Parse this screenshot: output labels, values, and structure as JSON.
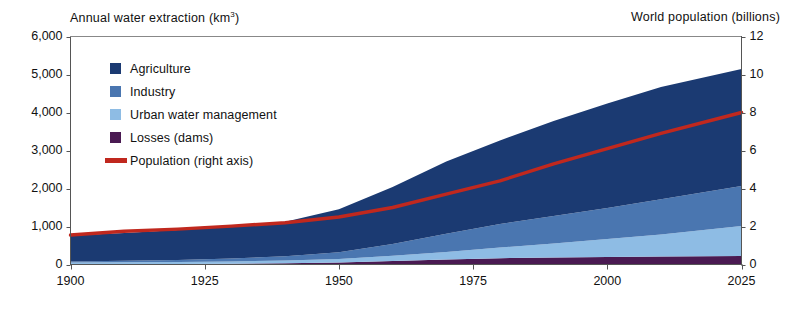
{
  "chart_data": {
    "type": "area",
    "title": "",
    "subtitle": "",
    "left_axis_title": "Annual water extraction (km",
    "left_axis_title_sup": "3",
    "left_axis_title_tail": ")",
    "right_axis_title": "World population (billions)",
    "xlabel": "",
    "ylabel": "Annual water extraction (km3)",
    "y2label": "World population (billions)",
    "grid": false,
    "legend_position": "inside-top-left",
    "xlim": [
      1900,
      2025
    ],
    "ylim": [
      0,
      6000
    ],
    "y2lim": [
      0,
      12
    ],
    "x_ticks": [
      1900,
      1925,
      1950,
      1975,
      2000,
      2025
    ],
    "x_tick_labels": [
      "1900",
      "1925",
      "1950",
      "1975",
      "2000",
      "2025"
    ],
    "y_ticks": [
      0,
      1000,
      2000,
      3000,
      4000,
      5000,
      6000
    ],
    "y_tick_labels": [
      "0",
      "1,000",
      "2,000",
      "3,000",
      "4,000",
      "5,000",
      "6,000"
    ],
    "y2_ticks": [
      0,
      2,
      4,
      6,
      8,
      10,
      12
    ],
    "y2_tick_labels": [
      "0",
      "2",
      "4",
      "6",
      "8",
      "10",
      "12"
    ],
    "x": [
      1900,
      1910,
      1920,
      1930,
      1940,
      1950,
      1960,
      1970,
      1980,
      1990,
      2000,
      2010,
      2025
    ],
    "stack_order_bottom_to_top": [
      "Losses (dams)",
      "Urban water management",
      "Industry",
      "Agriculture"
    ],
    "series": [
      {
        "name": "Losses (dams)",
        "color": "#4A1A52",
        "axis": "left",
        "values": [
          10,
          12,
          15,
          20,
          30,
          50,
          90,
          130,
          165,
          185,
          200,
          210,
          225
        ]
      },
      {
        "name": "Urban water management",
        "color": "#8EBCE4",
        "axis": "left",
        "values": [
          40,
          45,
          50,
          60,
          75,
          95,
          140,
          200,
          280,
          370,
          470,
          580,
          790
        ]
      },
      {
        "name": "Industry",
        "color": "#4A76B0",
        "axis": "left",
        "values": [
          30,
          40,
          55,
          80,
          110,
          180,
          310,
          480,
          620,
          720,
          820,
          930,
          1050
        ]
      },
      {
        "name": "Agriculture",
        "color": "#1B3A72",
        "axis": "left",
        "values": [
          680,
          730,
          790,
          850,
          910,
          1130,
          1500,
          1900,
          2200,
          2500,
          2750,
          2950,
          3080
        ]
      },
      {
        "name": "Population (right axis)",
        "color": "#C0281E",
        "axis": "right",
        "type": "line",
        "values": [
          1.55,
          1.75,
          1.86,
          2.02,
          2.2,
          2.5,
          3.0,
          3.7,
          4.4,
          5.3,
          6.1,
          6.9,
          8.0
        ]
      }
    ],
    "totals_left_axis": [
      760,
      827,
      910,
      1010,
      1125,
      1455,
      2040,
      2710,
      3265,
      3775,
      4240,
      4670,
      5145
    ],
    "annotations": []
  },
  "legend": {
    "items": [
      {
        "label": "Agriculture",
        "color": "#1B3A72",
        "marker": "square"
      },
      {
        "label": "Industry",
        "color": "#4A76B0",
        "marker": "square"
      },
      {
        "label": "Urban water management",
        "color": "#8EBCE4",
        "marker": "square"
      },
      {
        "label": "Losses (dams)",
        "color": "#4A1A52",
        "marker": "square"
      },
      {
        "label": "Population (right axis)",
        "color": "#C0281E",
        "marker": "line"
      }
    ]
  },
  "colors": {
    "agriculture": "#1B3A72",
    "industry": "#4A76B0",
    "urban_water_management": "#8EBCE4",
    "losses_dams": "#4A1A52",
    "population_line": "#C0281E",
    "axis": "#555555",
    "text": "#111111",
    "background": "#ffffff"
  }
}
